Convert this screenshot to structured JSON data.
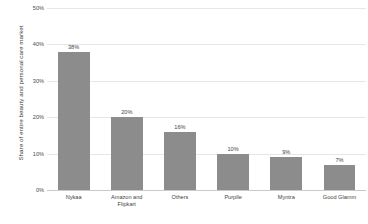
{
  "chart_data": {
    "type": "bar",
    "title": "",
    "subtitle": "",
    "xlabel": "",
    "ylabel": "Share of entire beauty and personal care market",
    "categories": [
      "Nykaa",
      "Amazon and Flipkart",
      "Others",
      "Purplle",
      "Myntra",
      "Good Glamm"
    ],
    "values": [
      38,
      20,
      16,
      10,
      9,
      7
    ],
    "value_labels": [
      "38%",
      "20%",
      "16%",
      "10%",
      "9%",
      "7%"
    ],
    "ylim": [
      0,
      50
    ],
    "yticks": [
      0,
      10,
      20,
      30,
      40,
      50
    ],
    "ytick_labels": [
      "0%",
      "10%",
      "20%",
      "30%",
      "40%",
      "50%"
    ],
    "grid": true,
    "legend": "none",
    "series": [
      {
        "name": "Share of entire beauty and personal care market",
        "values": [
          38,
          20,
          16,
          10,
          9,
          7
        ]
      }
    ],
    "colors": {
      "bar": "#8c8c8c",
      "gridline": "#e6e6e6",
      "axis": "#c9c9c9",
      "text": "#3f3f3f",
      "background": "#ffffff"
    }
  }
}
